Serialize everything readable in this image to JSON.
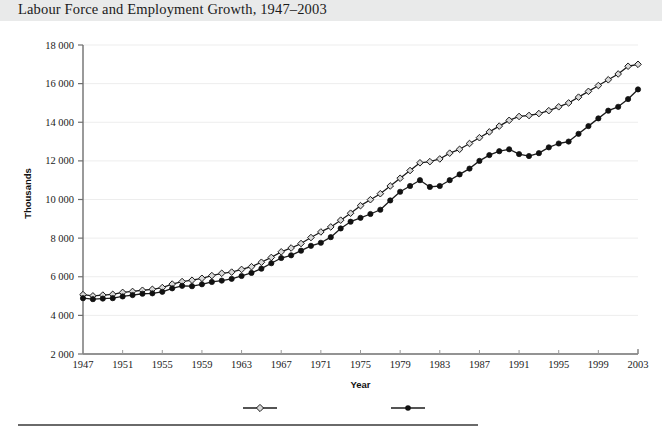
{
  "figure": {
    "title": "Labour Force and Employment Growth, 1947–2003",
    "header_band_color": "#e9eaea",
    "background_color": "#ffffff",
    "footer_rule_color": "#6a6a6a"
  },
  "legend": {
    "position": "bottom-center",
    "items": [
      {
        "label": "Labour force",
        "marker": "open-diamond",
        "color": "#1b1b1b",
        "fill": "#d9d9d9"
      },
      {
        "label": "Employment",
        "marker": "filled-circle",
        "color": "#111111",
        "fill": "#111111"
      }
    ]
  },
  "chart_data": {
    "type": "line",
    "title": "Labour Force and Employment Growth, 1947–2003",
    "xlabel": "Year",
    "ylabel": "Thousands",
    "xlim": [
      1947,
      2003
    ],
    "ylim": [
      2000,
      18000
    ],
    "grid": true,
    "y_ticks": [
      2000,
      4000,
      6000,
      8000,
      10000,
      12000,
      14000,
      16000,
      18000
    ],
    "y_tick_labels": [
      "2 000",
      "4 000",
      "6 000",
      "8 000",
      "10 000",
      "12 000",
      "14 000",
      "16 000",
      "18 000"
    ],
    "x_ticks": [
      1947,
      1951,
      1955,
      1959,
      1963,
      1967,
      1971,
      1975,
      1979,
      1983,
      1987,
      1991,
      1995,
      1999,
      2003
    ],
    "x_tick_labels": [
      "1947",
      "1951",
      "1955",
      "1959",
      "1963",
      "1967",
      "1971",
      "1975",
      "1979",
      "1983",
      "1987",
      "1991",
      "1995",
      "1999",
      "2003"
    ],
    "x": [
      1947,
      1948,
      1949,
      1950,
      1951,
      1952,
      1953,
      1954,
      1955,
      1956,
      1957,
      1958,
      1959,
      1960,
      1961,
      1962,
      1963,
      1964,
      1965,
      1966,
      1967,
      1968,
      1969,
      1970,
      1971,
      1972,
      1973,
      1974,
      1975,
      1976,
      1977,
      1978,
      1979,
      1980,
      1981,
      1982,
      1983,
      1984,
      1985,
      1986,
      1987,
      1988,
      1989,
      1990,
      1991,
      1992,
      1993,
      1994,
      1995,
      1996,
      1997,
      1998,
      1999,
      2000,
      2001,
      2002,
      2003
    ],
    "series": [
      {
        "name": "Labour force",
        "marker": "open-diamond",
        "values": [
          5075,
          5010,
          5050,
          5090,
          5190,
          5240,
          5300,
          5350,
          5440,
          5620,
          5750,
          5820,
          5920,
          6060,
          6180,
          6240,
          6380,
          6520,
          6750,
          7000,
          7290,
          7490,
          7720,
          8030,
          8320,
          8580,
          8930,
          9290,
          9680,
          9990,
          10300,
          10700,
          11100,
          11500,
          11900,
          11960,
          12100,
          12400,
          12600,
          12900,
          13200,
          13500,
          13800,
          14100,
          14300,
          14350,
          14450,
          14600,
          14800,
          15000,
          15300,
          15600,
          15900,
          16200,
          16500,
          16900,
          17000
        ]
      },
      {
        "name": "Employment",
        "marker": "filled-circle",
        "values": [
          4890,
          4840,
          4870,
          4890,
          4980,
          5050,
          5120,
          5140,
          5220,
          5400,
          5530,
          5510,
          5610,
          5730,
          5800,
          5890,
          6040,
          6200,
          6420,
          6700,
          6970,
          7110,
          7350,
          7600,
          7760,
          8050,
          8500,
          8850,
          9050,
          9250,
          9470,
          9950,
          10400,
          10700,
          11000,
          10650,
          10700,
          11000,
          11300,
          11600,
          12000,
          12300,
          12500,
          12600,
          12350,
          12250,
          12400,
          12700,
          12900,
          13000,
          13400,
          13800,
          14200,
          14600,
          14800,
          15200,
          15700
        ]
      }
    ]
  }
}
